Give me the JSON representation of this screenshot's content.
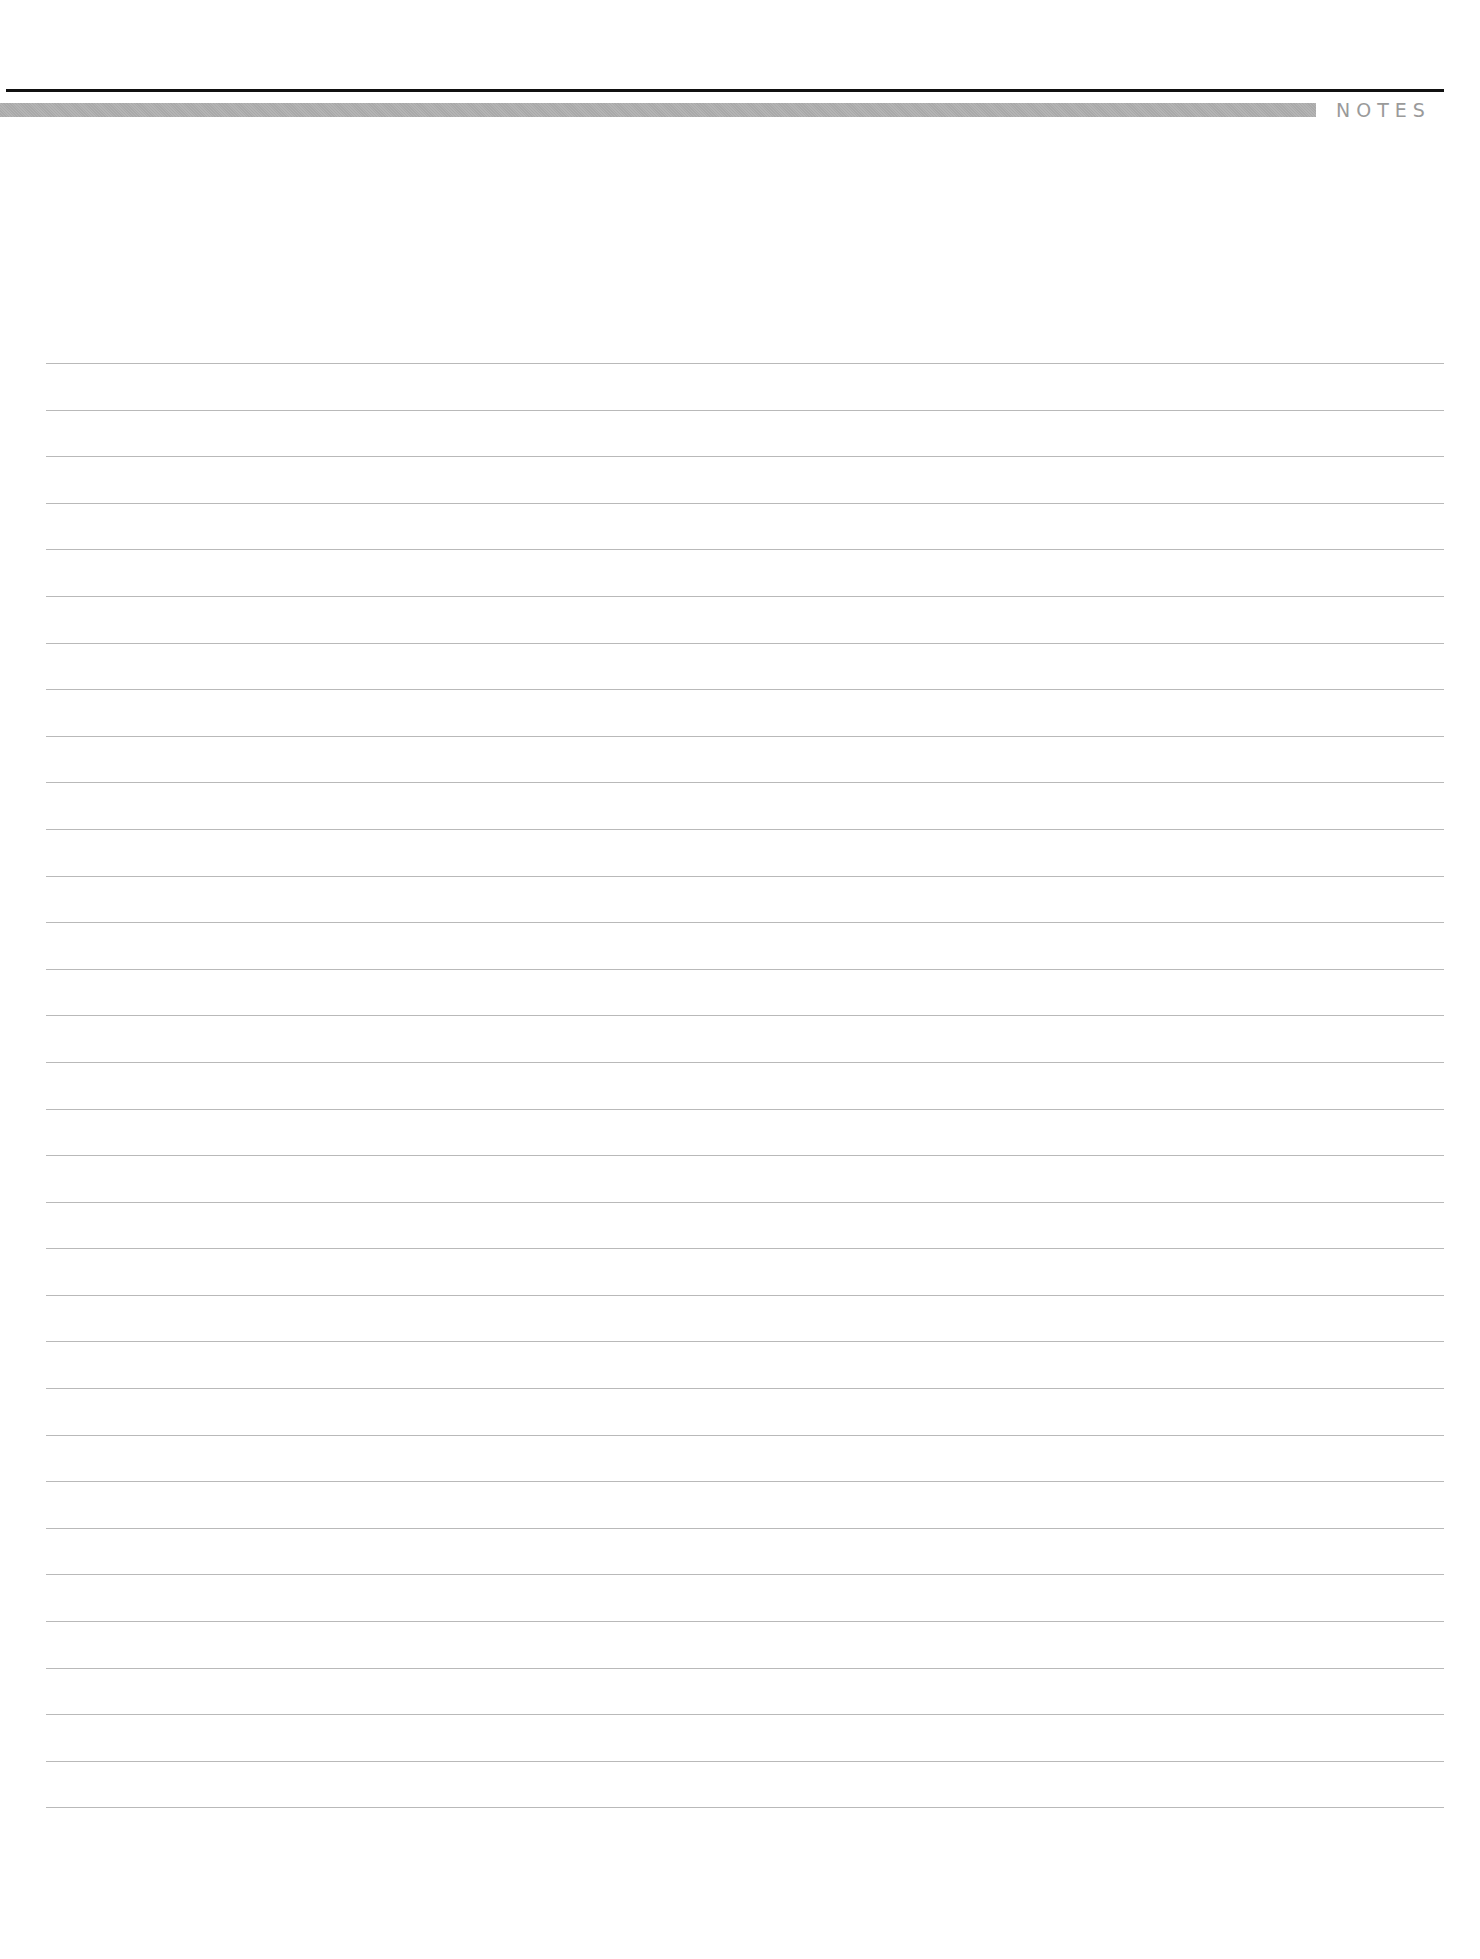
{
  "header": {
    "title": "NOTES",
    "rule_color": "#111111",
    "bar_color": "#acacac",
    "title_color": "#9a9a9a"
  },
  "notes": {
    "line_count": 32,
    "line_color": "#b9b9b9",
    "lines": [
      "",
      "",
      "",
      "",
      "",
      "",
      "",
      "",
      "",
      "",
      "",
      "",
      "",
      "",
      "",
      "",
      "",
      "",
      "",
      "",
      "",
      "",
      "",
      "",
      "",
      "",
      "",
      "",
      "",
      "",
      "",
      ""
    ]
  }
}
